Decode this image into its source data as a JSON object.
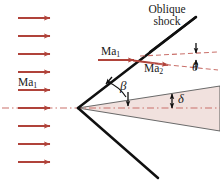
{
  "figure": {
    "width": 220,
    "height": 189,
    "background": "#ffffff"
  },
  "colors": {
    "flow_arrow": "#b0433a",
    "shock_line": "#101010",
    "wedge_fill": "#f1e1de",
    "wedge_edge": "#6a6a6a",
    "centerline_dash": "#c9706a",
    "label_text": "#1a1a1a"
  },
  "labels": {
    "oblique_shock": "Oblique\nshock",
    "oblique_shock_line1": "Oblique",
    "oblique_shock_line2": "shock",
    "ma1_upstream_left": "Ma",
    "ma1_upstream_left_sub": "1",
    "ma1_at_shock": "Ma",
    "ma1_at_shock_sub": "1",
    "ma2_downstream": "Ma",
    "ma2_downstream_sub": "2",
    "theta": "θ",
    "beta": "β",
    "delta": "δ"
  },
  "annotations": {
    "turning_angle_symbol": "θ",
    "shock_angle_symbol": "β",
    "wedge_half_angle_symbol": "δ"
  },
  "geometry": {
    "apex": {
      "x": 78,
      "y": 108
    },
    "shock_upper_end": {
      "x": 196,
      "y": 17
    },
    "shock_lower_end": {
      "x": 158,
      "y": 178
    },
    "wedge_upper_end": {
      "x": 220,
      "y": 86
    },
    "wedge_lower_end": {
      "x": 220,
      "y": 131
    },
    "centerline_y": 108,
    "centerline_x_start": 2,
    "centerline_x_end": 220,
    "shock_hit_point": {
      "x": 133,
      "y": 60
    },
    "deflected_line_end": {
      "x": 218,
      "y": 72
    }
  },
  "freestream_arrows": {
    "count": 9,
    "x_start": 18,
    "x_end": 56,
    "y_values": [
      18,
      36,
      54,
      72,
      90,
      108,
      126,
      144,
      162
    ]
  },
  "flow_vectors": [
    {
      "name": "ma1-shock-arrow",
      "x1": 98,
      "y1": 60,
      "x2": 136,
      "y2": 60
    },
    {
      "name": "ma2-deflected-arrow",
      "x1": 133,
      "y1": 61,
      "x2": 170,
      "y2": 66
    }
  ]
}
